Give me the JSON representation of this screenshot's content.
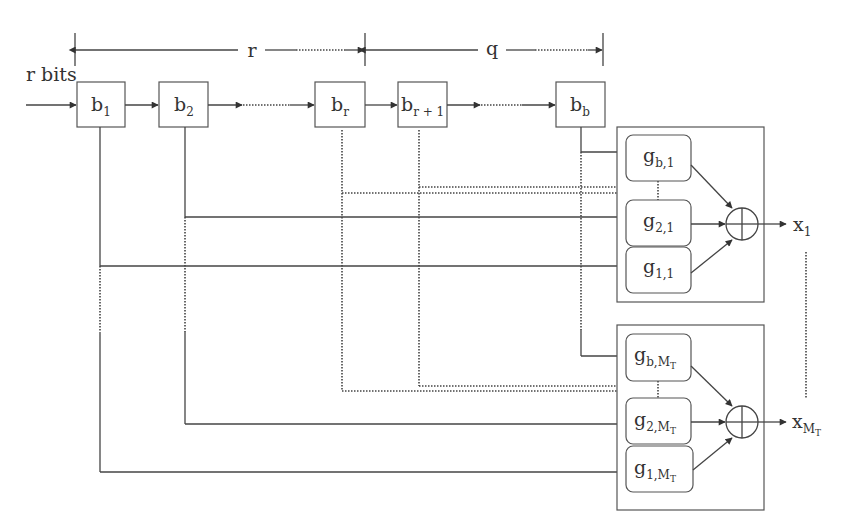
{
  "diagram": {
    "type": "block-diagram",
    "dimensions": {
      "r_label": "r",
      "q_label": "q"
    },
    "input_label": "r bits",
    "registers": [
      {
        "id": "b1",
        "base": "b",
        "sub": "1"
      },
      {
        "id": "b2",
        "base": "b",
        "sub": "2"
      },
      {
        "id": "br",
        "base": "b",
        "sub": "r"
      },
      {
        "id": "br1",
        "base": "b",
        "sub": "r + 1"
      },
      {
        "id": "bb",
        "base": "b",
        "sub": "b"
      }
    ],
    "modules": [
      {
        "id": "module-1",
        "generators": [
          {
            "base": "g",
            "sub": "b,1"
          },
          {
            "base": "g",
            "sub": "2,1"
          },
          {
            "base": "g",
            "sub": "1,1"
          }
        ],
        "adder_symbol": "⊕",
        "output": {
          "base": "x",
          "sub": "1",
          "subsub": ""
        }
      },
      {
        "id": "module-MT",
        "generators": [
          {
            "base": "g",
            "sub": "b,M",
            "subsub": "T"
          },
          {
            "base": "g",
            "sub": "2,M",
            "subsub": "T"
          },
          {
            "base": "g",
            "sub": "1,M",
            "subsub": "T"
          }
        ],
        "adder_symbol": "⊕",
        "output": {
          "base": "x",
          "sub": "M",
          "subsub": "T"
        }
      }
    ],
    "colors": {
      "line": "#444444",
      "background": "#ffffff",
      "text": "#333333"
    }
  }
}
